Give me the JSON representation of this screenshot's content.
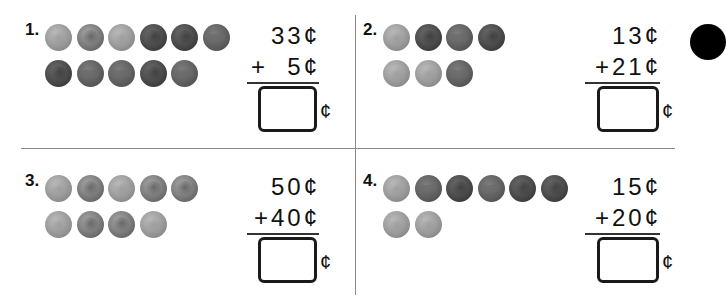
{
  "worksheet": {
    "problems": [
      {
        "label": "1.",
        "top_addend": "33¢",
        "bottom_addend": "+  5¢",
        "answer_value": "",
        "answer_unit": "¢",
        "coins_row1": [
          {
            "type": "dime",
            "side": "back"
          },
          {
            "type": "dime",
            "side": "front"
          },
          {
            "type": "dime",
            "side": "back"
          },
          {
            "type": "penny",
            "side": "front"
          },
          {
            "type": "penny",
            "side": "front"
          },
          {
            "type": "penny",
            "side": "back"
          }
        ],
        "coins_row2": [
          {
            "type": "penny",
            "side": "front"
          },
          {
            "type": "penny",
            "side": "back"
          },
          {
            "type": "penny",
            "side": "back"
          },
          {
            "type": "penny",
            "side": "front"
          },
          {
            "type": "penny",
            "side": "back"
          }
        ]
      },
      {
        "label": "2.",
        "top_addend": "13¢",
        "bottom_addend": "+21¢",
        "answer_value": "",
        "answer_unit": "¢",
        "coins_row1": [
          {
            "type": "dime",
            "side": "back"
          },
          {
            "type": "penny",
            "side": "front"
          },
          {
            "type": "penny",
            "side": "back"
          },
          {
            "type": "penny",
            "side": "front"
          }
        ],
        "coins_row2": [
          {
            "type": "dime",
            "side": "back"
          },
          {
            "type": "dime",
            "side": "back"
          },
          {
            "type": "penny",
            "side": "back"
          }
        ]
      },
      {
        "label": "3.",
        "top_addend": "50¢",
        "bottom_addend": "+40¢",
        "answer_value": "",
        "answer_unit": "¢",
        "coins_row1": [
          {
            "type": "dime",
            "side": "back"
          },
          {
            "type": "dime",
            "side": "front"
          },
          {
            "type": "dime",
            "side": "back"
          },
          {
            "type": "dime",
            "side": "front"
          },
          {
            "type": "dime",
            "side": "front"
          }
        ],
        "coins_row2": [
          {
            "type": "dime",
            "side": "back"
          },
          {
            "type": "dime",
            "side": "front"
          },
          {
            "type": "dime",
            "side": "front"
          },
          {
            "type": "dime",
            "side": "back"
          }
        ]
      },
      {
        "label": "4.",
        "top_addend": "15¢",
        "bottom_addend": "+20¢",
        "answer_value": "",
        "answer_unit": "¢",
        "coins_row1": [
          {
            "type": "dime",
            "side": "back"
          },
          {
            "type": "penny",
            "side": "back"
          },
          {
            "type": "penny",
            "side": "front"
          },
          {
            "type": "penny",
            "side": "back"
          },
          {
            "type": "penny",
            "side": "front"
          },
          {
            "type": "penny",
            "side": "front"
          }
        ],
        "coins_row2": [
          {
            "type": "dime",
            "side": "back"
          },
          {
            "type": "dime",
            "side": "back"
          }
        ]
      }
    ]
  }
}
